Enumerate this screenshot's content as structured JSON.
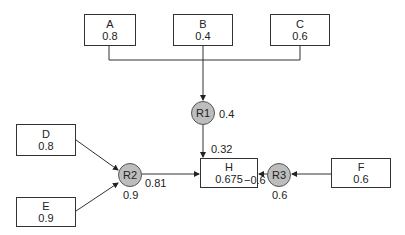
{
  "diagram": {
    "inputs": [
      {
        "id": "A",
        "value": "0.8"
      },
      {
        "id": "B",
        "value": "0.4"
      },
      {
        "id": "C",
        "value": "0.6"
      },
      {
        "id": "D",
        "value": "0.8"
      },
      {
        "id": "E",
        "value": "0.9"
      },
      {
        "id": "F",
        "value": "0.6"
      }
    ],
    "rules": [
      {
        "id": "R1",
        "weight": "0.4",
        "output": "0.32"
      },
      {
        "id": "R2",
        "weight": "0.9",
        "output": "0.81"
      },
      {
        "id": "R3",
        "weight": "0.6",
        "output": "−0.6"
      }
    ],
    "target": {
      "id": "H",
      "value": "0.675"
    }
  }
}
